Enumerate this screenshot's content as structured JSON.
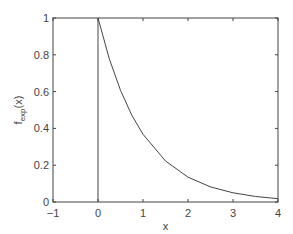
{
  "chart_data": {
    "type": "line",
    "title": "",
    "xlabel": "x",
    "ylabel": "f_exp(x)",
    "ylabel_main": "f",
    "ylabel_sub": "exp",
    "ylabel_tail": "(x)",
    "xlim": [
      -1,
      4
    ],
    "ylim": [
      0,
      1
    ],
    "grid": false,
    "xticks": [
      -1,
      0,
      1,
      2,
      3,
      4
    ],
    "xtick_labels": [
      "−1",
      "0",
      "1",
      "2",
      "3",
      "4"
    ],
    "yticks": [
      0,
      0.2,
      0.4,
      0.6,
      0.8,
      1
    ],
    "ytick_labels": [
      "0",
      "0.2",
      "0.4",
      "0.6",
      "0.8",
      "1"
    ],
    "series": [
      {
        "name": "f_exp(x) = exp(-x), x >= 0",
        "x": [
          0,
          0.25,
          0.5,
          0.75,
          1,
          1.5,
          2,
          2.5,
          3,
          3.5,
          4
        ],
        "y": [
          1,
          0.779,
          0.607,
          0.472,
          0.368,
          0.223,
          0.135,
          0.082,
          0.05,
          0.03,
          0.018
        ]
      },
      {
        "name": "vertical line at x=0",
        "x": [
          0,
          0
        ],
        "y": [
          0,
          1
        ]
      }
    ],
    "line_color": "#444444"
  }
}
